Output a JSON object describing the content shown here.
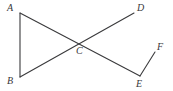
{
  "figure": {
    "background_color": "#ffffff",
    "stroke_color": "#3a3a3c",
    "label_color": "#38383a",
    "stroke_width": 1.1,
    "canvas": {
      "width": 173,
      "height": 91
    }
  },
  "points": [
    {
      "id": "A",
      "label": "A",
      "x": 20,
      "y": 13,
      "label_x": 7,
      "label_y": 3
    },
    {
      "id": "B",
      "label": "B",
      "x": 20,
      "y": 77,
      "label_x": 7,
      "label_y": 76
    },
    {
      "id": "C",
      "label": "C",
      "x": 81,
      "y": 42,
      "label_x": 76,
      "label_y": 46
    },
    {
      "id": "D",
      "label": "D",
      "x": 134,
      "y": 13,
      "label_x": 137,
      "label_y": 3
    },
    {
      "id": "E",
      "label": "E",
      "x": 140,
      "y": 76,
      "label_x": 136,
      "label_y": 79
    },
    {
      "id": "F",
      "label": "F",
      "x": 155,
      "y": 52,
      "label_x": 157,
      "label_y": 42
    }
  ],
  "segments": [
    {
      "id": "AB",
      "from": "A",
      "to": "B",
      "x1": 20,
      "y1": 13,
      "x2": 20,
      "y2": 77
    },
    {
      "id": "AE",
      "from": "A",
      "to": "E",
      "x1": 20,
      "y1": 13,
      "x2": 140,
      "y2": 76
    },
    {
      "id": "BD",
      "from": "B",
      "to": "D",
      "x1": 20,
      "y1": 77,
      "x2": 134,
      "y2": 13
    },
    {
      "id": "EF",
      "from": "E",
      "to": "F",
      "x1": 140,
      "y1": 76,
      "x2": 155,
      "y2": 52
    }
  ]
}
